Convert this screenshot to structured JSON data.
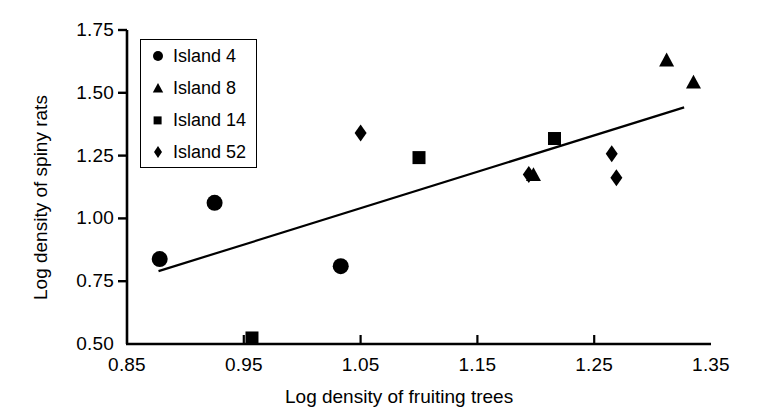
{
  "chart_data": {
    "type": "scatter",
    "title": "",
    "xlabel": "Log density of fruiting trees",
    "ylabel": "Log density of spiny rats",
    "xlim": [
      0.85,
      1.35
    ],
    "ylim": [
      0.5,
      1.75
    ],
    "xticks": [
      "0.85",
      "0.95",
      "1.05",
      "1.15",
      "1.25",
      "1.35"
    ],
    "xtick_values": [
      0.85,
      0.95,
      1.05,
      1.15,
      1.25,
      1.35
    ],
    "yticks": [
      "0.50",
      "0.75",
      "1.00",
      "1.25",
      "1.50",
      "1.75"
    ],
    "ytick_values": [
      0.5,
      0.75,
      1.0,
      1.25,
      1.5,
      1.75
    ],
    "grid": false,
    "legend_position": "top-left",
    "series": [
      {
        "name": "Island 4",
        "marker": "circle",
        "color": "#000000",
        "points": [
          {
            "x": 0.878,
            "y": 0.838
          },
          {
            "x": 0.925,
            "y": 1.062
          },
          {
            "x": 1.033,
            "y": 0.81
          }
        ]
      },
      {
        "name": "Island 8",
        "marker": "triangle",
        "color": "#000000",
        "points": [
          {
            "x": 1.198,
            "y": 1.172
          },
          {
            "x": 1.312,
            "y": 1.628
          },
          {
            "x": 1.335,
            "y": 1.54
          }
        ]
      },
      {
        "name": "Island 14",
        "marker": "square",
        "color": "#000000",
        "points": [
          {
            "x": 0.957,
            "y": 0.524
          },
          {
            "x": 1.1,
            "y": 1.242
          },
          {
            "x": 1.216,
            "y": 1.318
          }
        ]
      },
      {
        "name": "Island 52",
        "marker": "diamond",
        "color": "#000000",
        "points": [
          {
            "x": 1.05,
            "y": 1.34
          },
          {
            "x": 1.194,
            "y": 1.175
          },
          {
            "x": 1.265,
            "y": 1.257
          },
          {
            "x": 1.269,
            "y": 1.162
          }
        ]
      }
    ],
    "trendline": {
      "name": "regression-line",
      "x_start": 0.877,
      "y_start": 0.79,
      "x_end": 1.327,
      "y_end": 1.442
    }
  },
  "legend": {
    "items": [
      {
        "label": "Island 4",
        "marker": "circle"
      },
      {
        "label": "Island 8",
        "marker": "triangle"
      },
      {
        "label": "Island 14",
        "marker": "square"
      },
      {
        "label": "Island 52",
        "marker": "diamond"
      }
    ]
  }
}
